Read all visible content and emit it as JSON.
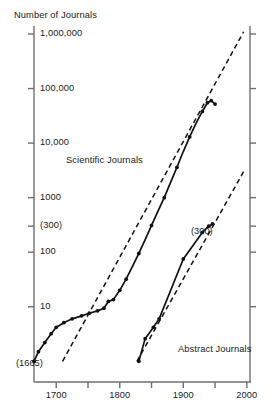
{
  "chart_data": {
    "type": "line",
    "title": "",
    "ylabel": "Number of Journals",
    "xlabel": "",
    "yscale": "log",
    "ylim": [
      1,
      1000000
    ],
    "xlim": [
      1665,
      2000
    ],
    "grid": false,
    "legend_position": "inline-annotation",
    "y_tick_labels": [
      "1,000,000",
      "100,000",
      "10,000",
      "1000",
      "(300)",
      "100",
      "10"
    ],
    "y_tick_values": [
      1000000,
      100000,
      10000,
      1000,
      300,
      100,
      10
    ],
    "x_tick_labels": [
      "1700",
      "1800",
      "1900",
      "2000"
    ],
    "x_tick_values": [
      1700,
      1800,
      1900,
      2000
    ],
    "x_minor_ticks": [
      1750,
      1850,
      1950
    ],
    "annotations": [
      {
        "text": "(1665)",
        "x": 1665,
        "y": 1
      },
      {
        "text": "(300)",
        "x": 1940,
        "y": 300
      }
    ],
    "series": [
      {
        "name": "Scientific Journals",
        "label": "Scientific Journals",
        "style": "solid-with-markers",
        "points": [
          {
            "x": 1665,
            "y": 1
          },
          {
            "x": 1672,
            "y": 1.5
          },
          {
            "x": 1682,
            "y": 2.2
          },
          {
            "x": 1692,
            "y": 3.2
          },
          {
            "x": 1700,
            "y": 4.2
          },
          {
            "x": 1712,
            "y": 5.1
          },
          {
            "x": 1725,
            "y": 6.0
          },
          {
            "x": 1740,
            "y": 6.8
          },
          {
            "x": 1752,
            "y": 7.6
          },
          {
            "x": 1765,
            "y": 8.4
          },
          {
            "x": 1775,
            "y": 9.4
          },
          {
            "x": 1782,
            "y": 12.5
          },
          {
            "x": 1790,
            "y": 13.5
          },
          {
            "x": 1800,
            "y": 20
          },
          {
            "x": 1810,
            "y": 32
          },
          {
            "x": 1820,
            "y": 55
          },
          {
            "x": 1830,
            "y": 95
          },
          {
            "x": 1840,
            "y": 170
          },
          {
            "x": 1850,
            "y": 310
          },
          {
            "x": 1860,
            "y": 560
          },
          {
            "x": 1870,
            "y": 1000
          },
          {
            "x": 1880,
            "y": 1900
          },
          {
            "x": 1890,
            "y": 3600
          },
          {
            "x": 1900,
            "y": 7000
          },
          {
            "x": 1910,
            "y": 13000
          },
          {
            "x": 1920,
            "y": 23000
          },
          {
            "x": 1930,
            "y": 38000
          },
          {
            "x": 1938,
            "y": 55000
          },
          {
            "x": 1944,
            "y": 60000
          },
          {
            "x": 1950,
            "y": 52000
          }
        ],
        "trend": {
          "style": "dashed",
          "points": [
            {
              "x": 1710,
              "y": 1
            },
            {
              "x": 1995,
              "y": 1100000
            }
          ]
        }
      },
      {
        "name": "Abstract Journals",
        "label": "Abstract Journals",
        "style": "solid-with-markers",
        "points": [
          {
            "x": 1830,
            "y": 1
          },
          {
            "x": 1840,
            "y": 2.6
          },
          {
            "x": 1853,
            "y": 4.2
          },
          {
            "x": 1862,
            "y": 6.0
          },
          {
            "x": 1900,
            "y": 75
          },
          {
            "x": 1930,
            "y": 230
          },
          {
            "x": 1940,
            "y": 300
          },
          {
            "x": 1946,
            "y": 330
          }
        ],
        "trend": {
          "style": "dashed",
          "points": [
            {
              "x": 1827,
              "y": 1
            },
            {
              "x": 1995,
              "y": 3000
            }
          ]
        }
      }
    ]
  }
}
